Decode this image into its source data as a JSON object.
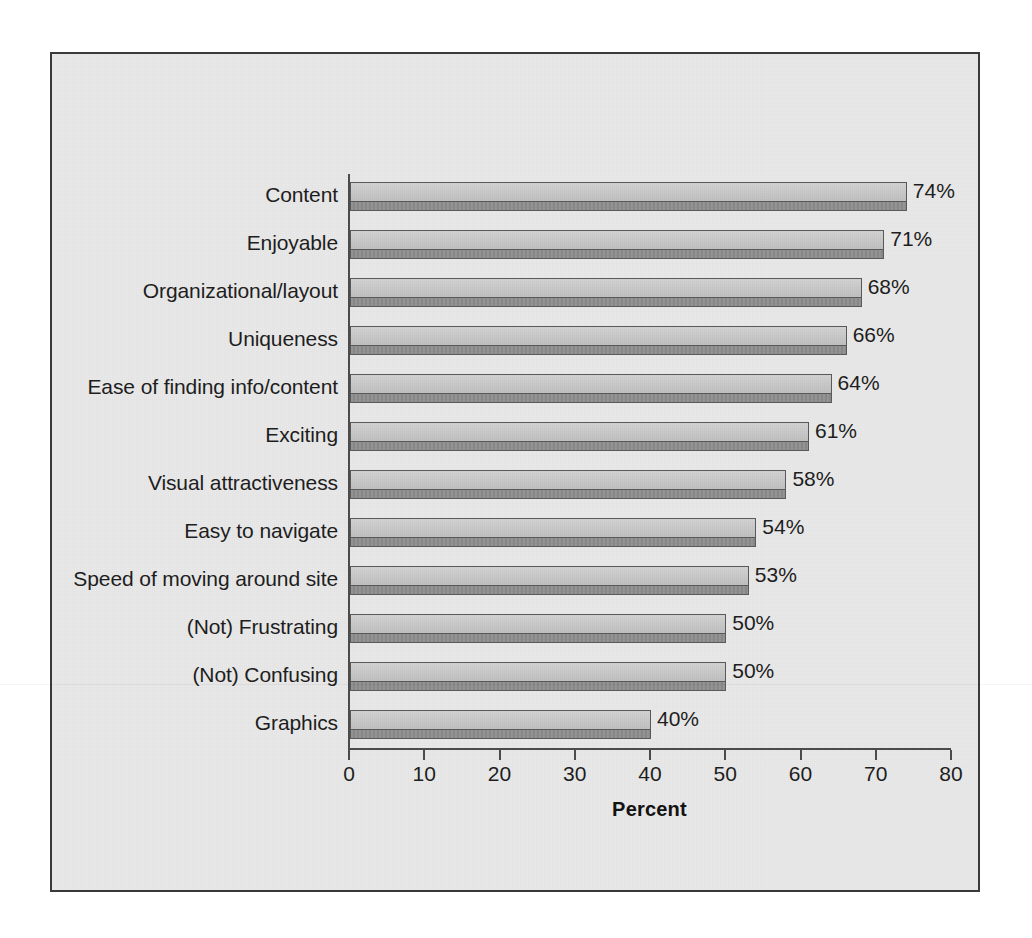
{
  "chart_data": {
    "type": "bar",
    "orientation": "horizontal",
    "title": "",
    "xlabel": "Percent",
    "ylabel": "",
    "xlim": [
      0,
      80
    ],
    "xticks": [
      0,
      10,
      20,
      30,
      40,
      50,
      60,
      70,
      80
    ],
    "grid": false,
    "legend": false,
    "value_suffix": "%",
    "categories": [
      "Content",
      "Enjoyable",
      "Organizational/layout",
      "Uniqueness",
      "Ease of finding info/content",
      "Exciting",
      "Visual attractiveness",
      "Easy to navigate",
      "Speed of moving around site",
      "(Not) Frustrating",
      "(Not) Confusing",
      "Graphics"
    ],
    "values": [
      74,
      71,
      68,
      66,
      64,
      61,
      58,
      54,
      53,
      50,
      50,
      40
    ],
    "value_labels": [
      "74%",
      "71%",
      "68%",
      "66%",
      "64%",
      "61%",
      "58%",
      "54%",
      "53%",
      "50%",
      "50%",
      "40%"
    ],
    "xtick_labels": [
      "0",
      "10",
      "20",
      "30",
      "40",
      "50",
      "60",
      "70",
      "80"
    ]
  },
  "style": {
    "panel_background": "#e9e9e9",
    "frame_border": "#3a3a3a",
    "bar_face": "#c9c9c9",
    "bar_depth": "#8e8e8e",
    "bar_outline": "#585858",
    "axis_color": "#4a4a4a",
    "text_color": "#1b1b1b"
  }
}
